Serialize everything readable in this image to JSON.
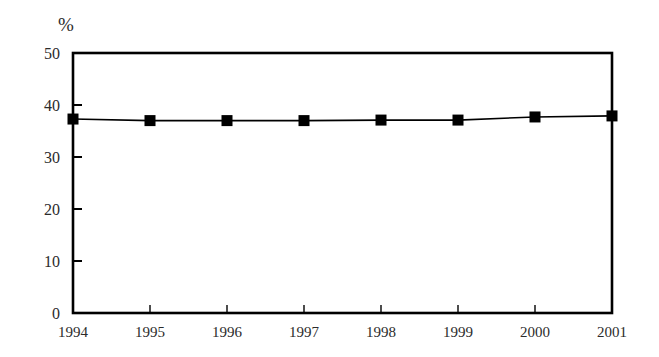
{
  "chart_data": {
    "type": "line",
    "title": "",
    "subtitle": "",
    "xlabel": "",
    "ylabel": "%",
    "unit_label": "%",
    "categories": [
      "1994",
      "1995",
      "1996",
      "1997",
      "1998",
      "1999",
      "2000",
      "2001"
    ],
    "x": [
      1994,
      1995,
      1996,
      1997,
      1998,
      1999,
      2000,
      2001
    ],
    "values": [
      37.3,
      37.0,
      37.0,
      37.0,
      37.1,
      37.1,
      37.7,
      37.9
    ],
    "series": [
      {
        "name": "",
        "values": [
          37.3,
          37.0,
          37.0,
          37.0,
          37.1,
          37.1,
          37.7,
          37.9
        ],
        "marker": "square",
        "marker_color": "#000000",
        "line_color": "#000000"
      }
    ],
    "ylim": [
      0,
      50
    ],
    "yticks": [
      0,
      10,
      20,
      30,
      40,
      50
    ],
    "ytick_labels": [
      "0",
      "10",
      "20",
      "30",
      "40",
      "50"
    ],
    "xtick_labels": [
      "1994",
      "1995",
      "1996",
      "1997",
      "1998",
      "1999",
      "2000",
      "2001"
    ],
    "grid": false,
    "legend": false,
    "legend_position": "none",
    "tick_direction": "in",
    "frame": "box",
    "colors": {
      "line": "#000000",
      "marker": "#000000",
      "axis": "#000000",
      "text": "#2b2b2b",
      "background": "#ffffff"
    }
  }
}
